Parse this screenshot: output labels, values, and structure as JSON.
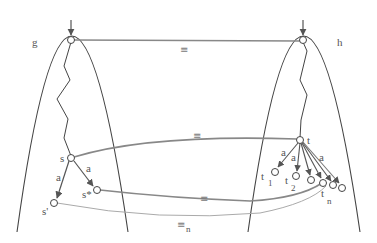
{
  "diagram": {
    "systems": [
      {
        "id": "g",
        "label": "g"
      },
      {
        "id": "h",
        "label": "h"
      }
    ],
    "states": {
      "s": "s",
      "s_star": "s*",
      "s_prime": "s'",
      "t": "t",
      "t1": "t",
      "t1_sub": "1",
      "t2": "t",
      "t2_sub": "2",
      "tn": "t",
      "tn_sub": "n"
    },
    "transition_label": "a",
    "relations": {
      "initial": "≡",
      "s_t": "≡",
      "sstar_tn": "≡",
      "sprime_tn": "≡",
      "sprime_tn_sub": "n"
    },
    "colors": {
      "outline": "#444444",
      "relation_line": "#888888",
      "relation_line_light": "#aaaaaa",
      "arrow": "#555555"
    }
  }
}
